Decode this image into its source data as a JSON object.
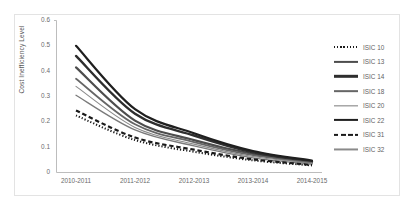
{
  "figure": {
    "background": "#ffffff",
    "border_color": "#e3e3e3"
  },
  "chart_data": {
    "type": "line",
    "title": "",
    "xlabel": "",
    "ylabel": "Cost Inefficiency Level",
    "categories": [
      "2010-2011",
      "2011-2012",
      "2012-2013",
      "2013-2014",
      "2014-2015"
    ],
    "ylim": [
      0,
      0.6
    ],
    "yticks": [
      "0",
      "0.1",
      "0.2",
      "0.3",
      "0.4",
      "0.5",
      "0.6"
    ],
    "ytick_values": [
      0,
      0.1,
      0.2,
      0.3,
      0.4,
      0.5,
      0.6
    ],
    "grid": false,
    "legend_position": "right",
    "series": [
      {
        "name": "ISIC 10",
        "style": "dotted",
        "color": "#1a1a1a",
        "width": 2.0,
        "values": [
          0.225,
          0.128,
          0.082,
          0.048,
          0.028
        ]
      },
      {
        "name": "ISIC 13",
        "style": "solid",
        "color": "#4d4d4d",
        "width": 2.2,
        "values": [
          0.415,
          0.205,
          0.128,
          0.073,
          0.04
        ]
      },
      {
        "name": "ISIC 14",
        "style": "solid",
        "color": "#2e2e2e",
        "width": 2.4,
        "values": [
          0.46,
          0.232,
          0.146,
          0.08,
          0.044
        ]
      },
      {
        "name": "ISIC 18",
        "style": "solid",
        "color": "#666666",
        "width": 1.7,
        "values": [
          0.37,
          0.19,
          0.12,
          0.068,
          0.038
        ]
      },
      {
        "name": "ISIC 20",
        "style": "solid",
        "color": "#7a7a7a",
        "width": 1.3,
        "values": [
          0.305,
          0.168,
          0.105,
          0.058,
          0.033
        ]
      },
      {
        "name": "ISIC 22",
        "style": "solid",
        "color": "#1f1f1f",
        "width": 2.2,
        "values": [
          0.5,
          0.25,
          0.155,
          0.085,
          0.047
        ]
      },
      {
        "name": "ISIC 31",
        "style": "dashed",
        "color": "#1a1a1a",
        "width": 2.2,
        "values": [
          0.245,
          0.138,
          0.09,
          0.052,
          0.03
        ]
      },
      {
        "name": "ISIC 32",
        "style": "solid",
        "color": "#8a8a8a",
        "width": 1.1,
        "values": [
          0.34,
          0.178,
          0.112,
          0.063,
          0.036
        ]
      }
    ]
  }
}
